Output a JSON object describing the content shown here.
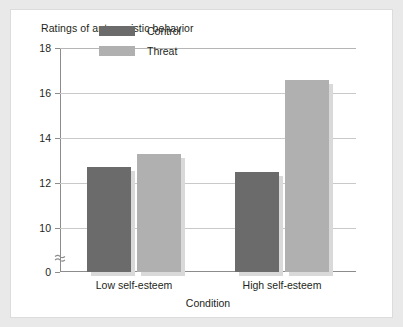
{
  "chart_data": {
    "type": "bar",
    "title": "Ratings of antagonistic behavior",
    "xlabel": "Condition",
    "ylabel": "",
    "categories": [
      "Low self-esteem",
      "High self-esteem"
    ],
    "series": [
      {
        "name": "Control",
        "color": "#6b6b6b",
        "values": [
          12.7,
          12.5
        ]
      },
      {
        "name": "Threat",
        "color": "#b0b0b0",
        "values": [
          13.3,
          16.6
        ]
      }
    ],
    "yticks": [
      0,
      10,
      12,
      14,
      16,
      18
    ],
    "ytick_labels": [
      "0",
      "10",
      "12",
      "14",
      "16",
      "18"
    ],
    "ylim": [
      0,
      18
    ],
    "axis_break": true,
    "axis_break_between": [
      0,
      10
    ],
    "grid": true,
    "legend_position": "top-center"
  },
  "legend": {
    "items": [
      {
        "label": "Control",
        "color": "#6b6b6b"
      },
      {
        "label": "Threat",
        "color": "#b0b0b0"
      }
    ]
  }
}
